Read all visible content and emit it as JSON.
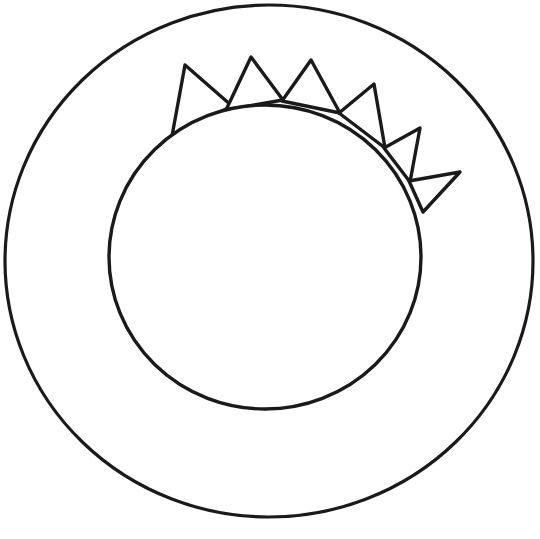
{
  "canvas": {
    "width": 540,
    "height": 539,
    "background_color": "#ffffff",
    "title": "Sun line drawing coloring page"
  },
  "style": {
    "stroke_color": "#1a1a1a",
    "fill_color": "#ffffff",
    "outer_ring_stroke_width": 3.2,
    "inner_disc_stroke_width": 3.4,
    "ray_stroke_width": 3.4
  },
  "shapes": {
    "outer_ring": {
      "label": "Outer ring circle",
      "cx": 269,
      "cy": 261,
      "rx": 264,
      "ry": 256
    },
    "inner_disc": {
      "label": "Inner sun disc",
      "cx": 265,
      "cy": 257,
      "rx": 156,
      "ry": 152
    },
    "rays": {
      "label": "Triangular sun rays",
      "count": 6,
      "items": [
        {
          "name": "ray-1",
          "apex": [
            185,
            65
          ],
          "base_left": [
            172,
            136
          ],
          "base_right": [
            232,
            106
          ]
        },
        {
          "name": "ray-2",
          "apex": [
            251,
            57
          ],
          "base_left": [
            226,
            110
          ],
          "base_right": [
            283,
            100
          ]
        },
        {
          "name": "ray-3",
          "apex": [
            311,
            60
          ],
          "base_left": [
            282,
            101
          ],
          "base_right": [
            340,
            113
          ]
        },
        {
          "name": "ray-4",
          "apex": [
            374,
            84
          ],
          "base_left": [
            339,
            113
          ],
          "base_right": [
            385,
            148
          ]
        },
        {
          "name": "ray-5",
          "apex": [
            420,
            128
          ],
          "base_left": [
            384,
            148
          ],
          "base_right": [
            410,
            182
          ]
        },
        {
          "name": "ray-6",
          "apex": [
            460,
            172
          ],
          "base_left": [
            409,
            181
          ],
          "base_right": [
            423,
            212
          ]
        }
      ]
    }
  }
}
